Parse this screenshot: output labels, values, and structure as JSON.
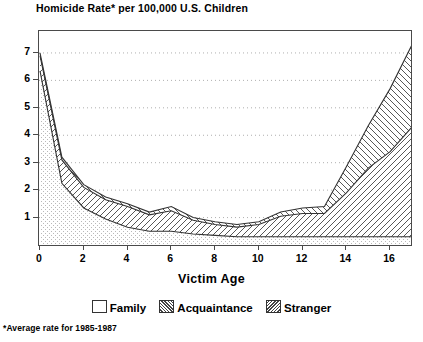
{
  "chart_data": {
    "type": "area",
    "title": "Homicide Rate* per 100,000 U.S. Children",
    "xlabel": "Victim Age",
    "ylabel": "",
    "xlim": [
      0,
      17
    ],
    "ylim": [
      0,
      7.8
    ],
    "grid": true,
    "stacked": true,
    "legend_position": "bottom",
    "x": [
      0,
      1,
      2,
      3,
      4,
      5,
      6,
      7,
      8,
      9,
      10,
      11,
      12,
      13,
      14,
      15,
      16,
      17
    ],
    "xticks": [
      "0",
      "2",
      "4",
      "6",
      "8",
      "10",
      "12",
      "14",
      "16"
    ],
    "xtick_values": [
      0,
      2,
      4,
      6,
      8,
      10,
      12,
      14,
      16
    ],
    "yticks": [
      "1",
      "2",
      "3",
      "4",
      "5",
      "6",
      "7"
    ],
    "ytick_values": [
      1,
      2,
      3,
      4,
      5,
      6,
      7
    ],
    "series": [
      {
        "name": "Family",
        "pattern": "stipple",
        "values": [
          6.35,
          2.25,
          1.35,
          0.95,
          0.65,
          0.5,
          0.5,
          0.4,
          0.35,
          0.3,
          0.3,
          0.3,
          0.3,
          0.3,
          0.3,
          0.3,
          0.3,
          0.3
        ]
      },
      {
        "name": "Acquaintance",
        "pattern": "forward-hatch",
        "values": [
          0.55,
          0.85,
          0.75,
          0.7,
          0.75,
          0.6,
          0.75,
          0.5,
          0.4,
          0.35,
          0.45,
          0.75,
          0.85,
          0.85,
          1.6,
          2.5,
          3.1,
          4.0
        ]
      },
      {
        "name": "Stranger",
        "pattern": "back-hatch",
        "values": [
          0.1,
          0.1,
          0.1,
          0.1,
          0.1,
          0.1,
          0.15,
          0.1,
          0.1,
          0.1,
          0.1,
          0.15,
          0.2,
          0.25,
          0.95,
          1.55,
          2.3,
          3.0
        ]
      }
    ],
    "totals": [
      7.0,
      3.2,
      2.2,
      1.75,
      1.5,
      1.2,
      1.4,
      1.0,
      0.85,
      0.75,
      0.85,
      1.2,
      1.35,
      1.4,
      2.85,
      4.35,
      5.7,
      7.3
    ],
    "footnote": "*Average rate for 1985-1987"
  },
  "legend": {
    "items": [
      {
        "label": "Family"
      },
      {
        "label": "Acquaintance"
      },
      {
        "label": "Stranger"
      }
    ]
  },
  "colors": {
    "line": "#333333",
    "grid": "#9a9a9a",
    "frame": "#4a4a4a",
    "text": "#000000",
    "background": "#ffffff"
  }
}
